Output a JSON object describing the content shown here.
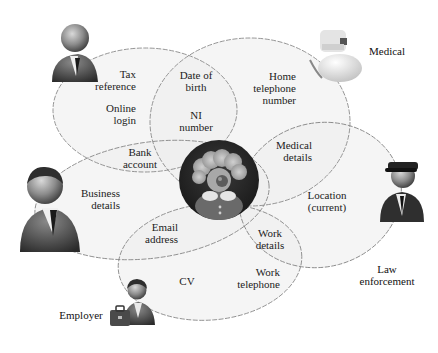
{
  "diagram": {
    "title": "",
    "center": {
      "name": "Data subject",
      "icon": "clown-person-icon"
    },
    "actors": {
      "tax": {
        "label": "",
        "icon": "businessman-icon"
      },
      "medical": {
        "label": "Medical",
        "icon": "doctor-icon"
      },
      "business": {
        "label": "",
        "icon": "businessman-icon"
      },
      "law": {
        "label": "Law enforcement",
        "line1": "Law",
        "line2": "enforcement",
        "icon": "police-officer-icon"
      },
      "employer": {
        "label": "Employer",
        "icon": "employer-briefcase-icon"
      }
    },
    "items": {
      "tax_ref": {
        "line1": "Tax",
        "line2": "reference"
      },
      "online_login": {
        "line1": "Online",
        "line2": "login"
      },
      "dob": {
        "line1": "Date of",
        "line2": "birth"
      },
      "ni": {
        "line1": "NI",
        "line2": "number"
      },
      "home_tel": {
        "line1": "Home",
        "line2": "telephone",
        "line3": "number"
      },
      "bank": {
        "line1": "Bank",
        "line2": "account"
      },
      "medical_details": {
        "line1": "Medical",
        "line2": "details"
      },
      "business_details": {
        "line1": "Business",
        "line2": "details"
      },
      "location": {
        "line1": "Location",
        "line2": "(current)"
      },
      "email": {
        "line1": "Email",
        "line2": "address"
      },
      "work_details": {
        "line1": "Work",
        "line2": "details"
      },
      "cv": {
        "line1": "CV"
      },
      "work_tel": {
        "line1": "Work",
        "line2": "telephone"
      }
    },
    "colors": {
      "ellipse_fill": "#f0f0f0",
      "ellipse_stroke": "#8a8a8a",
      "center_disc": "#262626",
      "text": "#222222"
    }
  }
}
